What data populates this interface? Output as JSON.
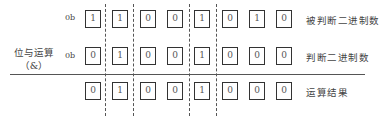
{
  "diagram": {
    "operation": {
      "line1": "位与运算",
      "line2": "（&）"
    },
    "prefix": "0b",
    "rows": [
      {
        "label": "被判断二进制数",
        "has_prefix": true,
        "bits": [
          "1",
          "1",
          "0",
          "0",
          "1",
          "0",
          "1",
          "0"
        ]
      },
      {
        "label": "判断二进制数",
        "has_prefix": true,
        "bits": [
          "0",
          "1",
          "0",
          "0",
          "1",
          "0",
          "0",
          "0"
        ]
      },
      {
        "label": "运算结果",
        "has_prefix": false,
        "bits": [
          "0",
          "1",
          "0",
          "0",
          "1",
          "0",
          "0",
          "0"
        ]
      }
    ],
    "dashed_separators_between_bits": [
      1,
      2,
      4,
      5
    ]
  }
}
